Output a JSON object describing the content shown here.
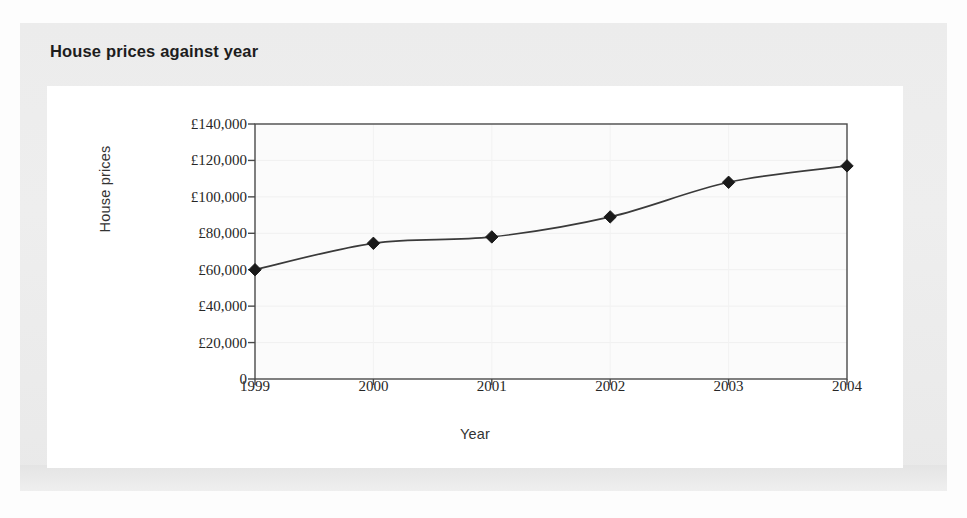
{
  "figure": {
    "title": "House prices against year"
  },
  "chart_data": {
    "type": "line",
    "title": "House prices against year",
    "xlabel": "Year",
    "ylabel": "House prices",
    "categories": [
      "1999",
      "2000",
      "2001",
      "2002",
      "2003",
      "2004"
    ],
    "x": [
      1999,
      2000,
      2001,
      2002,
      2003,
      2004
    ],
    "values": [
      60000,
      74500,
      78000,
      89000,
      108000,
      117000
    ],
    "series": [
      {
        "name": "House prices",
        "values": [
          60000,
          74500,
          78000,
          89000,
          108000,
          117000
        ]
      }
    ],
    "y_tick_labels": [
      "£140,000",
      "£120,000",
      "£100,000",
      "£80,000",
      "£60,000",
      "£40,000",
      "£20,000",
      "0"
    ],
    "y_tick_values": [
      140000,
      120000,
      100000,
      80000,
      60000,
      40000,
      20000,
      0
    ],
    "x_tick_labels": [
      "1999",
      "2000",
      "2001",
      "2002",
      "2003",
      "2004"
    ],
    "ylim": [
      0,
      140000
    ],
    "xlim": [
      1999,
      2004
    ],
    "grid": true,
    "legend": "none",
    "marker": "diamond",
    "marker_color": "#1a1a1a",
    "line_color": "#3a3a3a",
    "plot_background": "#fbfbfb",
    "currency_symbol": "£"
  }
}
